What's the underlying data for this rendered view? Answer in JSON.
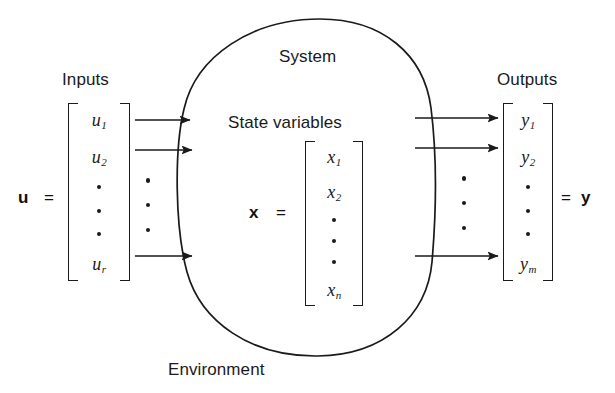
{
  "diagram": {
    "labels": {
      "inputs": "Inputs",
      "system": "System",
      "state_variables": "State variables",
      "outputs": "Outputs",
      "environment": "Environment"
    },
    "equals_sign": "=",
    "input_vector": {
      "name": "u",
      "entries": [
        "u",
        "u",
        "•",
        "•",
        "•",
        "u"
      ],
      "subscripts": [
        "1",
        "2",
        "",
        "",
        "",
        "r"
      ],
      "dimension_symbol": "r"
    },
    "state_vector": {
      "name": "x",
      "entries": [
        "x",
        "x",
        "•",
        "•",
        "•",
        "x"
      ],
      "subscripts": [
        "1",
        "2",
        "",
        "",
        "",
        "n"
      ],
      "dimension_symbol": "n"
    },
    "output_vector": {
      "name": "y",
      "entries": [
        "y",
        "y",
        "•",
        "•",
        "•",
        "y"
      ],
      "subscripts": [
        "1",
        "2",
        "",
        "",
        "",
        "m"
      ],
      "dimension_symbol": "m"
    },
    "arrows": {
      "input_count": 3,
      "output_count": 3,
      "ellipsis_dots": 3
    },
    "colors": {
      "stroke": "#1a1a1a",
      "background": "#ffffff",
      "text": "#1a1a1a"
    }
  }
}
